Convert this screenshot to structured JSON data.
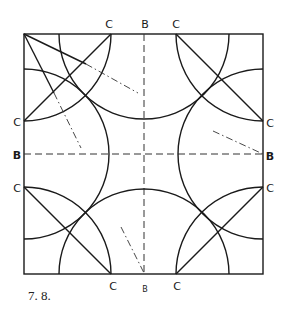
{
  "figure": {
    "caption": "7. 8.",
    "labels": {
      "top": [
        "C",
        "B",
        "C"
      ],
      "bottom": [
        "C",
        "B",
        "C"
      ],
      "left": [
        "C",
        "B",
        "C"
      ],
      "right": [
        "C",
        "B",
        "C"
      ]
    }
  }
}
